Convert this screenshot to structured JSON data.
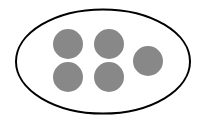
{
  "diagram": {
    "set": {
      "shape": "ellipse",
      "cx": 103,
      "cy": 61.5,
      "rx": 87,
      "ry": 52,
      "stroke": "#000000",
      "fill": "#ffffff",
      "stroke_width": 2
    },
    "dot_color": "#888888",
    "dot_radius": 15,
    "dots": [
      {
        "cx": 68,
        "cy": 44
      },
      {
        "cx": 109,
        "cy": 44
      },
      {
        "cx": 148,
        "cy": 61
      },
      {
        "cx": 68,
        "cy": 77
      },
      {
        "cx": 109,
        "cy": 77
      }
    ],
    "count": 5
  }
}
